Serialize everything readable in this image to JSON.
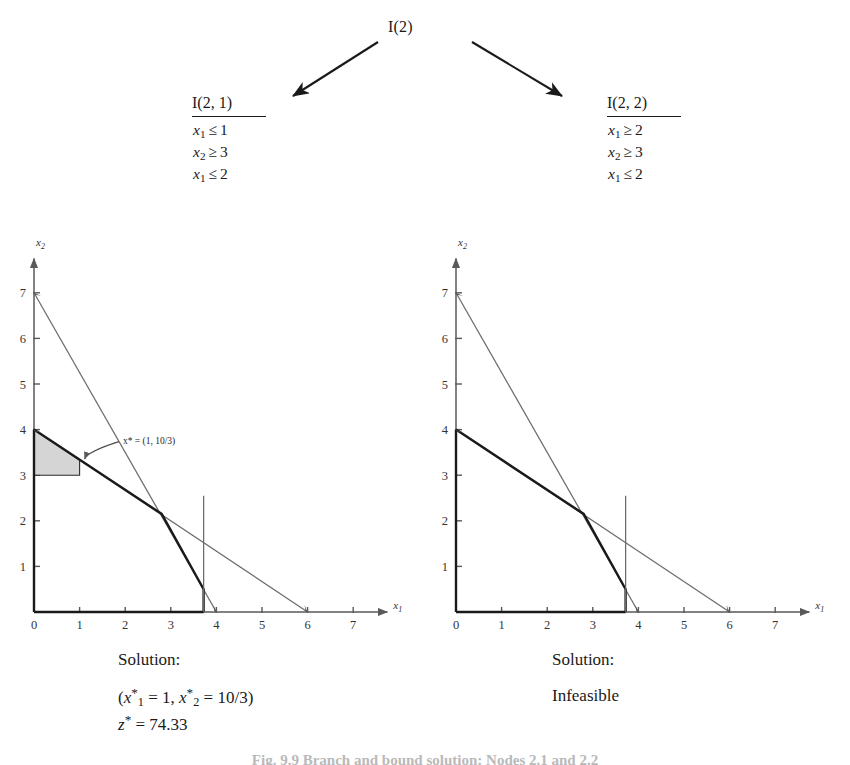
{
  "tree": {
    "root_label": "I(2)",
    "nodes": [
      {
        "title": "I(2, 1)",
        "constraints": [
          {
            "var": "x",
            "sub": "1",
            "rel": "≤",
            "value": "1"
          },
          {
            "var": "x",
            "sub": "2",
            "rel": "≥",
            "value": "3"
          },
          {
            "var": "x",
            "sub": "1",
            "rel": "≤",
            "value": "2"
          }
        ]
      },
      {
        "title": "I(2, 2)",
        "constraints": [
          {
            "var": "x",
            "sub": "1",
            "rel": "≥",
            "value": "2"
          },
          {
            "var": "x",
            "sub": "2",
            "rel": "≥",
            "value": "3"
          },
          {
            "var": "x",
            "sub": "1",
            "rel": "≤",
            "value": "2"
          }
        ]
      }
    ]
  },
  "solutions": [
    {
      "label": "Solution:",
      "lines": [
        "(x*₁ = 1, x*₂ = 10/3)",
        "z* = 74.33"
      ],
      "x1": "1",
      "x2": "10/3",
      "z": "74.33",
      "status": ""
    },
    {
      "label": "Solution:",
      "lines": [
        "Infeasible"
      ],
      "status": "Infeasible"
    }
  ],
  "caption": "Fig. 9.9   Branch and bound solution: Nodes 2.1 and 2.2",
  "chart_data": [
    {
      "type": "line",
      "title": "I(2, 1) feasible region",
      "xlabel": "x1",
      "ylabel": "x2",
      "xlim": [
        0,
        7.6
      ],
      "ylim": [
        0,
        7.6
      ],
      "xticks": [
        "0",
        "1",
        "2",
        "3",
        "4",
        "5",
        "6",
        "7"
      ],
      "yticks": [
        "1",
        "2",
        "3",
        "4",
        "5",
        "6",
        "7"
      ],
      "grid": false,
      "legend": "none",
      "series": [
        {
          "name": "constraint-steep",
          "style": "thin",
          "points": [
            [
              0,
              7
            ],
            [
              4,
              0
            ]
          ]
        },
        {
          "name": "constraint-shallow",
          "style": "thin",
          "points": [
            [
              0,
              4
            ],
            [
              6,
              0
            ]
          ]
        },
        {
          "name": "boundary-bold",
          "style": "bold",
          "points": [
            [
              0,
              4
            ],
            [
              2.8,
              2.15
            ],
            [
              3.72,
              0.5
            ],
            [
              3.72,
              0
            ]
          ]
        },
        {
          "name": "boundary-bold-base",
          "style": "bold",
          "points": [
            [
              0,
              0
            ],
            [
              3.72,
              0
            ]
          ]
        },
        {
          "name": "boundary-bold-axis",
          "style": "bold",
          "points": [
            [
              0,
              0
            ],
            [
              0,
              4
            ]
          ]
        },
        {
          "name": "x1-upper-bound",
          "style": "vertical",
          "points": [
            [
              3.72,
              0
            ],
            [
              3.72,
              2.55
            ]
          ]
        }
      ],
      "shaded_region": {
        "name": "feasible-region",
        "vertices": [
          [
            0,
            4
          ],
          [
            1,
            3.333
          ],
          [
            1,
            3
          ],
          [
            0,
            3
          ]
        ]
      },
      "annotations": [
        {
          "name": "optimum-label",
          "text": "x* = (1, 10/3)",
          "point": [
            1,
            3.333
          ],
          "label_at": [
            1.95,
            3.78
          ]
        }
      ]
    },
    {
      "type": "line",
      "title": "I(2, 2) feasible region (empty)",
      "xlabel": "x1",
      "ylabel": "x2",
      "xlim": [
        0,
        7.6
      ],
      "ylim": [
        0,
        7.6
      ],
      "xticks": [
        "0",
        "1",
        "2",
        "3",
        "4",
        "5",
        "6",
        "7"
      ],
      "yticks": [
        "1",
        "2",
        "3",
        "4",
        "5",
        "6",
        "7"
      ],
      "grid": false,
      "legend": "none",
      "series": [
        {
          "name": "constraint-steep",
          "style": "thin",
          "points": [
            [
              0,
              7
            ],
            [
              4,
              0
            ]
          ]
        },
        {
          "name": "constraint-shallow",
          "style": "thin",
          "points": [
            [
              0,
              4
            ],
            [
              6,
              0
            ]
          ]
        },
        {
          "name": "boundary-bold",
          "style": "bold",
          "points": [
            [
              0,
              4
            ],
            [
              2.8,
              2.15
            ],
            [
              3.72,
              0.5
            ],
            [
              3.72,
              0
            ]
          ]
        },
        {
          "name": "boundary-bold-base",
          "style": "bold",
          "points": [
            [
              0,
              0
            ],
            [
              3.72,
              0
            ]
          ]
        },
        {
          "name": "boundary-bold-axis",
          "style": "bold",
          "points": [
            [
              0,
              0
            ],
            [
              0,
              4
            ]
          ]
        },
        {
          "name": "x1-upper-bound",
          "style": "vertical",
          "points": [
            [
              3.72,
              0
            ],
            [
              3.72,
              2.55
            ]
          ]
        }
      ],
      "shaded_region": null,
      "annotations": []
    }
  ]
}
